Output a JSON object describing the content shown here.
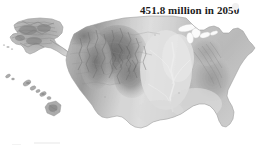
{
  "figure": {
    "type": "shaded-relief-map",
    "region": "United States",
    "background_color": "#ffffff",
    "annotation": {
      "text": "451.8 million in 2050",
      "color": "#1b1b1b"
    },
    "insets": [
      {
        "name": "alaska-inset",
        "label": "Alaska"
      },
      {
        "name": "hawaii-inset",
        "label": "Hawaii"
      }
    ],
    "palette": {
      "lowland": "#e3e3e3",
      "plains": "#d4d4d4",
      "midland": "#c2c2c2",
      "upland": "#aeaeae",
      "highland": "#949494",
      "mountain": "#7c7c7c",
      "peak": "#636363",
      "outline": "#8f8f8f"
    }
  }
}
